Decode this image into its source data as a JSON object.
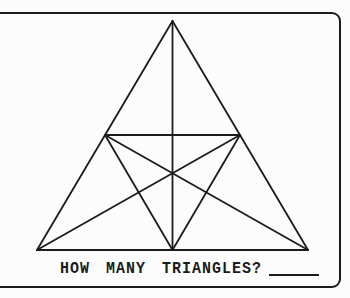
{
  "colors": {
    "ink": "#1c1c1c",
    "paper": "#fcfcfc"
  },
  "card": {
    "type": "scanned-puzzle-card"
  },
  "question": {
    "label": "HOW MANY TRIANGLES?",
    "answer": ""
  },
  "figure": {
    "stroke_width": 1.8,
    "points": {
      "apex": [
        172.5,
        21
      ],
      "bottom_left": [
        37,
        250
      ],
      "bottom_right": [
        308,
        250
      ],
      "bottom_mid": [
        172.5,
        250
      ],
      "left_mid": [
        105,
        135
      ],
      "right_mid": [
        240,
        135
      ]
    },
    "segments": [
      [
        "apex",
        "bottom_left"
      ],
      [
        "apex",
        "bottom_right"
      ],
      [
        "bottom_left",
        "bottom_right"
      ],
      [
        "apex",
        "bottom_mid"
      ],
      [
        "left_mid",
        "right_mid"
      ],
      [
        "left_mid",
        "bottom_mid"
      ],
      [
        "right_mid",
        "bottom_mid"
      ],
      [
        "left_mid",
        "bottom_right"
      ],
      [
        "right_mid",
        "bottom_left"
      ]
    ]
  }
}
